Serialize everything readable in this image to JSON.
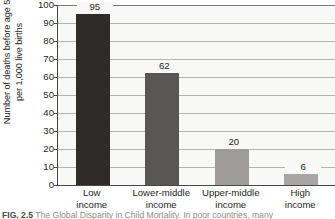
{
  "chart_data": {
    "type": "bar",
    "title": "",
    "xlabel": "",
    "ylabel": "Number of deaths before age 5\nper 1,000 live births",
    "categories": [
      "Low\nincome",
      "Lower-middle\nincome",
      "Upper-middle\nincome",
      "High\nincome"
    ],
    "values": [
      95,
      62,
      20,
      6
    ],
    "value_labels": [
      "95",
      "62",
      "20",
      "6"
    ],
    "ylim": [
      0,
      100
    ],
    "ytick_labels": [
      "100",
      "90",
      "80",
      "70",
      "60",
      "50",
      "40",
      "30",
      "20",
      "10",
      "0"
    ],
    "ytick_values": [
      100,
      90,
      80,
      70,
      60,
      50,
      40,
      30,
      20,
      10,
      0
    ],
    "grid": true,
    "legend": "none",
    "bar_colors": [
      "#2e2b29",
      "#595755",
      "#9e9c9a",
      "#a8a6a4"
    ],
    "axis_color": "#4a4846",
    "gridline_color": "#b4b3b0",
    "plot_background": "#f8f8f6"
  },
  "caption": {
    "figure_number": "FIG. 2.5",
    "text": "The Global Disparity in Child Mortality. In poor countries, many"
  }
}
